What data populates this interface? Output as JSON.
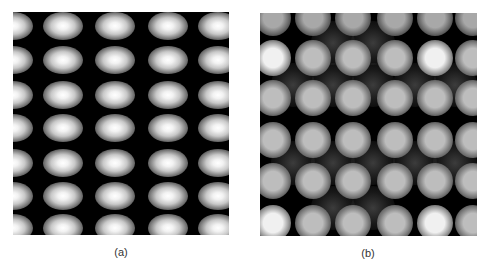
{
  "figure": {
    "panels": [
      {
        "id": "a",
        "label": "(a)",
        "description": "regular lattice of horizontally elongated bright spots",
        "columns_x": [
          0,
          50,
          102,
          155,
          205
        ],
        "rows_y": [
          14,
          48,
          83,
          116,
          151,
          184,
          216
        ],
        "spot_shape": "ellipse"
      },
      {
        "id": "b",
        "label": "(b)",
        "description": "lattice of round gray spots with varying brightness and interstitial halos",
        "columns_x": [
          13,
          53,
          93,
          135,
          175,
          213
        ],
        "rows_y": [
          5,
          45,
          85,
          127,
          168,
          210
        ],
        "spot_shape": "circle"
      }
    ]
  }
}
